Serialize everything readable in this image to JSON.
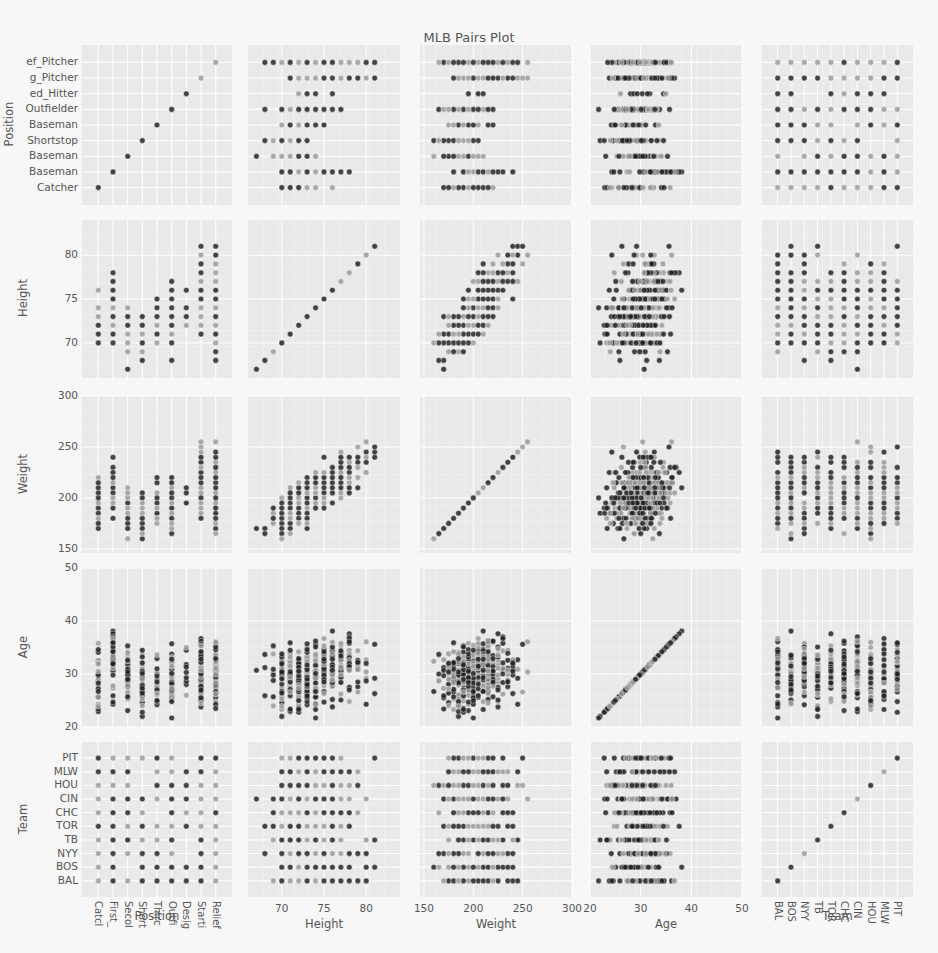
{
  "title": "MLB Pairs Plot",
  "chart_data": {
    "type": "scatter",
    "subtype": "pairs_plot_scatter_matrix",
    "title": "MLB Pairs Plot",
    "variables": [
      "Position",
      "Height",
      "Weight",
      "Age",
      "Team"
    ],
    "marker": {
      "color_dark": "#222222",
      "color_light": "#9a9a9a",
      "size": 5,
      "opacity": 0.85
    },
    "grid": true,
    "legend": "none",
    "axes": {
      "Position": {
        "kind": "categorical",
        "label": "Position",
        "categories": [
          "Catcher",
          "First_Baseman",
          "Second_Baseman",
          "Shortstop",
          "Third_Baseman",
          "Outfielder",
          "Designated_Hitter",
          "Starting_Pitcher",
          "Relief_Pitcher"
        ],
        "y_tick_labels_visible": [
          "Catcher",
          "Baseman",
          "Baseman",
          "Shortstop",
          "Baseman",
          "Outfielder",
          "ed_Hitter",
          "g_Pitcher",
          "ef_Pitcher"
        ],
        "x_tick_labels_visible": [
          "Catcl",
          "First_",
          "Secol",
          "Short",
          "Thirc",
          "Outfi",
          "Desig",
          "Starti",
          "Relief"
        ]
      },
      "Height": {
        "kind": "numeric",
        "label": "Height",
        "range": [
          66,
          84
        ],
        "ticks": [
          70,
          75,
          80
        ]
      },
      "Weight": {
        "kind": "numeric",
        "label": "Weight",
        "range": [
          146,
          300
        ],
        "ticks": [
          150,
          200,
          250,
          300
        ]
      },
      "Age": {
        "kind": "numeric",
        "label": "Age",
        "range": [
          20,
          50
        ],
        "ticks": [
          20,
          30,
          40,
          50
        ]
      },
      "Team": {
        "kind": "categorical",
        "label": "Team",
        "categories": [
          "BAL",
          "BOS",
          "NYY",
          "TB",
          "TOR",
          "CHC",
          "CIN",
          "HOU",
          "MLW",
          "PIT"
        ],
        "y_tick_labels_visible": [
          "BAL",
          "BOS",
          "NYY",
          "TB",
          "TOR",
          "CHC",
          "CIN",
          "HOU",
          "MLW",
          "PIT"
        ],
        "x_tick_labels_visible": [
          "BAL",
          "BOS",
          "NYY",
          "TB",
          "TOR",
          "CHC",
          "CIN",
          "HOU",
          "MLW",
          "PIT"
        ]
      }
    },
    "position_summary": [
      {
        "position": "Catcher",
        "height_range": [
          69,
          76
        ],
        "weight_range": [
          170,
          245
        ],
        "age_range": [
          22,
          39
        ]
      },
      {
        "position": "First_Baseman",
        "height_range": [
          70,
          80
        ],
        "weight_range": [
          180,
          260
        ],
        "age_range": [
          23,
          48
        ]
      },
      {
        "position": "Second_Baseman",
        "height_range": [
          67,
          75
        ],
        "weight_range": [
          160,
          210
        ],
        "age_range": [
          23,
          41
        ]
      },
      {
        "position": "Shortstop",
        "height_range": [
          67,
          75
        ],
        "weight_range": [
          150,
          210
        ],
        "age_range": [
          22,
          40
        ]
      },
      {
        "position": "Third_Baseman",
        "height_range": [
          68,
          77
        ],
        "weight_range": [
          170,
          240
        ],
        "age_range": [
          22,
          37
        ]
      },
      {
        "position": "Outfielder",
        "height_range": [
          68,
          78
        ],
        "weight_range": [
          160,
          257
        ],
        "age_range": [
          21,
          43
        ]
      },
      {
        "position": "Designated_Hitter",
        "height_range": [
          70,
          77
        ],
        "weight_range": [
          195,
          275
        ],
        "age_range": [
          24,
          39
        ]
      },
      {
        "position": "Starting_Pitcher",
        "height_range": [
          69,
          82
        ],
        "weight_range": [
          150,
          290
        ],
        "age_range": [
          21,
          44
        ]
      },
      {
        "position": "Relief_Pitcher",
        "height_range": [
          68,
          83
        ],
        "weight_range": [
          150,
          278
        ],
        "age_range": [
          22,
          42
        ]
      }
    ],
    "approx_trends": {
      "Height_vs_Weight": "positive correlation; height 67-83, weight 150-290",
      "Age_vs_Weight": "cloud centered ~200 lb, ages 21-48",
      "diagonal": "identity line (variable vs itself)"
    },
    "seed": 7,
    "n_points": 420
  }
}
